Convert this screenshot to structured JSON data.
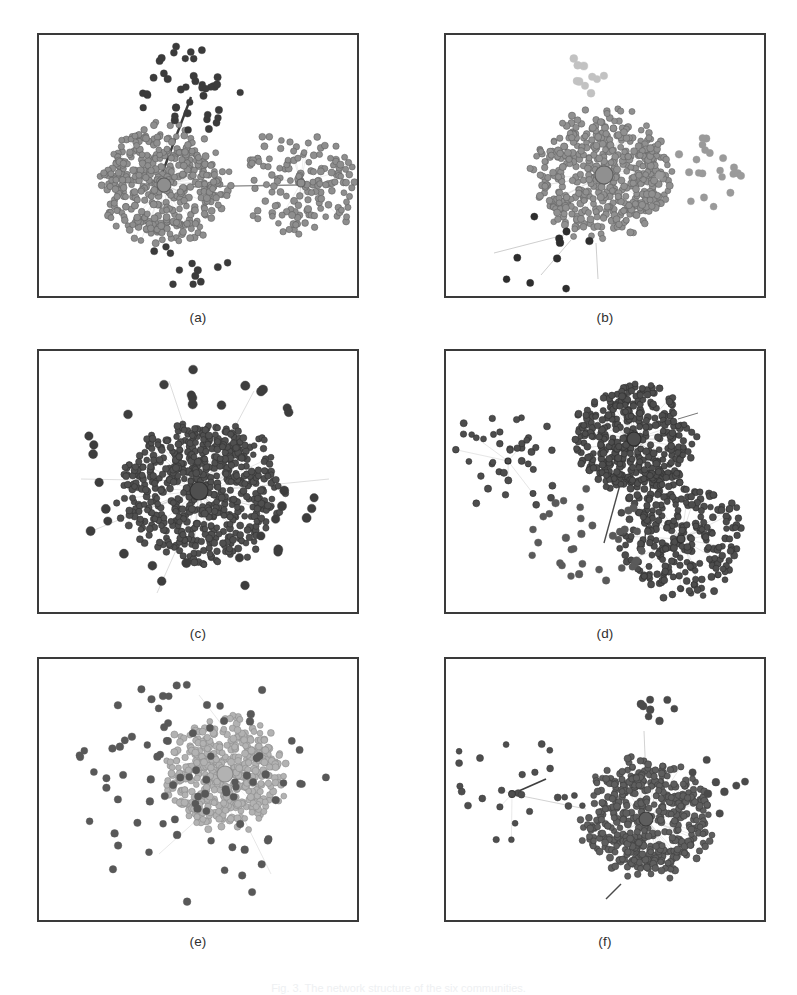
{
  "figure": {
    "caption": "Fig. 3. The network structure of the six communities.",
    "caption_color": "#eef0f2",
    "background": "#ffffff",
    "frame_color": "#3a3a3a",
    "width": 797,
    "height": 995
  },
  "layout": {
    "columns": 2,
    "rows": 3,
    "panel_width": 322,
    "panel_height": 265,
    "col_x": [
      37,
      444
    ],
    "row_y": [
      33,
      349,
      657
    ],
    "label_offset_y": 12
  },
  "panels": [
    {
      "id": "a",
      "label": "(a)",
      "node_color": "#8e8e8e",
      "node_stroke": "#5d5d5d",
      "outlier_color": "#3b3b3b",
      "edge_color": "#c9c9c9",
      "long_edge_color": "#4a4a4a",
      "description": "two dense communities joined by long bridge edges",
      "chart": {
        "seed": 1207,
        "clusters": [
          {
            "cx": 125,
            "cy": 150,
            "r": 62,
            "n": 430,
            "shade": "#8e8e8e",
            "hub": true,
            "hub_r": 7,
            "spread": 1.0
          },
          {
            "cx": 262,
            "cy": 148,
            "r": 46,
            "n": 150,
            "shade": "#8e8e8e",
            "hub": true,
            "hub_r": 4,
            "spread": 1.25
          }
        ],
        "outliers": [
          {
            "cx": 150,
            "cy": 55,
            "r": 52,
            "n": 42,
            "shade": "#3b3b3b",
            "size": 3.3
          },
          {
            "cx": 150,
            "cy": 232,
            "r": 44,
            "n": 12,
            "shade": "#3b3b3b",
            "size": 3.3
          }
        ],
        "bridges": [
          {
            "x1": 118,
            "y1": 152,
            "x2": 152,
            "y2": 62,
            "w": 2.4,
            "color": "#3d3d3d"
          },
          {
            "x1": 140,
            "y1": 152,
            "x2": 258,
            "y2": 150,
            "w": 1.3,
            "color": "#8a8a8a"
          }
        ]
      }
    },
    {
      "id": "b",
      "label": "(b)",
      "node_color": "#909090",
      "node_stroke": "#5f5f5f",
      "outlier_color": "#2e2e2e",
      "edge_color": "#cccccc",
      "long_edge_color": "#9a9a9a",
      "description": "single giant community with a large central hub, light satellites above, dark isolates below",
      "chart": {
        "seed": 3391,
        "clusters": [
          {
            "cx": 158,
            "cy": 140,
            "r": 66,
            "n": 520,
            "shade": "#909090",
            "hub": true,
            "hub_r": 9,
            "spread": 1.0
          }
        ],
        "outliers": [
          {
            "cx": 140,
            "cy": 42,
            "r": 24,
            "n": 10,
            "shade": "#c2c2c2",
            "size": 3.6
          },
          {
            "cx": 255,
            "cy": 140,
            "r": 42,
            "n": 22,
            "shade": "#9a9a9a",
            "size": 3.4
          },
          {
            "cx": 110,
            "cy": 228,
            "r": 56,
            "n": 10,
            "shade": "#2e2e2e",
            "size": 3.4
          }
        ],
        "bridges": [
          {
            "x1": 118,
            "y1": 200,
            "x2": 48,
            "y2": 218,
            "w": 0.8,
            "color": "#c2c2c2"
          },
          {
            "x1": 125,
            "y1": 205,
            "x2": 95,
            "y2": 240,
            "w": 0.8,
            "color": "#c2c2c2"
          },
          {
            "x1": 150,
            "y1": 208,
            "x2": 152,
            "y2": 244,
            "w": 0.8,
            "color": "#c2c2c2"
          }
        ]
      }
    },
    {
      "id": "c",
      "label": "(c)",
      "node_color": "#4f4f4f",
      "node_stroke": "#303030",
      "outlier_color": "#3a3a3a",
      "edge_color": "#b8b8b8",
      "long_edge_color": "#c0c0c0",
      "description": "one very dense dark community with radiating pendant nodes",
      "chart": {
        "seed": 5523,
        "clusters": [
          {
            "cx": 160,
            "cy": 140,
            "r": 76,
            "n": 640,
            "shade": "#4f4f4f",
            "hub": true,
            "hub_r": 9,
            "spread": 1.0
          }
        ],
        "outliers": [
          {
            "cx": 160,
            "cy": 130,
            "r": 118,
            "n": 34,
            "shade": "#3d3d3d",
            "size": 4.2,
            "ring": true
          }
        ],
        "bridges": [
          {
            "x1": 150,
            "y1": 130,
            "x2": 42,
            "y2": 128,
            "w": 0.7,
            "color": "#cfcfcf"
          },
          {
            "x1": 150,
            "y1": 140,
            "x2": 48,
            "y2": 182,
            "w": 0.7,
            "color": "#cfcfcf"
          },
          {
            "x1": 160,
            "y1": 120,
            "x2": 130,
            "y2": 30,
            "w": 0.7,
            "color": "#cfcfcf"
          },
          {
            "x1": 170,
            "y1": 125,
            "x2": 215,
            "y2": 40,
            "w": 0.7,
            "color": "#cfcfcf"
          },
          {
            "x1": 190,
            "y1": 138,
            "x2": 290,
            "y2": 128,
            "w": 0.7,
            "color": "#cfcfcf"
          },
          {
            "x1": 150,
            "y1": 170,
            "x2": 118,
            "y2": 242,
            "w": 0.7,
            "color": "#cfcfcf"
          }
        ]
      }
    },
    {
      "id": "d",
      "label": "(d)",
      "node_color": "#4d4d4d",
      "node_stroke": "#2c2c2c",
      "outlier_color": "#4a4a4a",
      "edge_color": "#b5b5b5",
      "long_edge_color": "#555555",
      "description": "three communities: small left satellite, large upper-centre core, lower-right star community",
      "chart": {
        "seed": 7741,
        "clusters": [
          {
            "cx": 188,
            "cy": 88,
            "r": 58,
            "n": 400,
            "shade": "#4d4d4d",
            "hub": true,
            "hub_r": 7,
            "spread": 1.0
          },
          {
            "cx": 235,
            "cy": 188,
            "r": 48,
            "n": 250,
            "shade": "#4d4d4d",
            "hub": true,
            "hub_r": 4,
            "spread": 1.25
          },
          {
            "cx": 62,
            "cy": 110,
            "r": 34,
            "n": 40,
            "shade": "#4d4d4d",
            "hub": true,
            "hub_r": 3,
            "spread": 1.6
          }
        ],
        "outliers": [
          {
            "cx": 140,
            "cy": 185,
            "r": 60,
            "n": 34,
            "shade": "#5a5a5a",
            "size": 3.4
          }
        ],
        "bridges": [
          {
            "x1": 175,
            "y1": 130,
            "x2": 158,
            "y2": 192,
            "w": 1.4,
            "color": "#4a4a4a"
          },
          {
            "x1": 205,
            "y1": 132,
            "x2": 198,
            "y2": 196,
            "w": 1.4,
            "color": "#4a4a4a"
          },
          {
            "x1": 232,
            "y1": 68,
            "x2": 252,
            "y2": 62,
            "w": 1.0,
            "color": "#777777"
          }
        ]
      }
    },
    {
      "id": "e",
      "label": "(e)",
      "node_color": "#b2b2b2",
      "node_stroke": "#8a8a8a",
      "outlier_color": "#555555",
      "edge_color": "#d8d8d8",
      "long_edge_color": "#cfcfcf",
      "description": "light-toned central community surrounded by many dark scattered isolates",
      "chart": {
        "seed": 9013,
        "clusters": [
          {
            "cx": 186,
            "cy": 115,
            "r": 58,
            "n": 470,
            "shade": "#b2b2b2",
            "hub": true,
            "hub_r": 8,
            "spread": 1.0
          }
        ],
        "outliers": [
          {
            "cx": 160,
            "cy": 130,
            "r": 128,
            "n": 86,
            "shade": "#585858",
            "size": 3.4,
            "ring": false
          }
        ],
        "bridges": [
          {
            "x1": 170,
            "y1": 150,
            "x2": 120,
            "y2": 195,
            "w": 0.7,
            "color": "#dcdcdc"
          },
          {
            "x1": 200,
            "y1": 150,
            "x2": 232,
            "y2": 215,
            "w": 0.7,
            "color": "#dcdcdc"
          },
          {
            "x1": 186,
            "y1": 70,
            "x2": 160,
            "y2": 36,
            "w": 0.7,
            "color": "#dcdcdc"
          }
        ]
      }
    },
    {
      "id": "f",
      "label": "(f)",
      "node_color": "#5e5e5e",
      "node_stroke": "#3a3a3a",
      "outlier_color": "#4a4a4a",
      "edge_color": "#c0c0c0",
      "long_edge_color": "#3f3f3f",
      "description": "large dark community on the right linked to a small star-shaped community on the left",
      "chart": {
        "seed": 2468,
        "clusters": [
          {
            "cx": 200,
            "cy": 160,
            "r": 62,
            "n": 470,
            "shade": "#5e5e5e",
            "hub": true,
            "hub_r": 7,
            "spread": 1.0
          },
          {
            "cx": 66,
            "cy": 135,
            "r": 36,
            "n": 26,
            "shade": "#4e4e4e",
            "hub": true,
            "hub_r": 3.4,
            "spread": 1.9
          }
        ],
        "outliers": [
          {
            "cx": 205,
            "cy": 60,
            "r": 28,
            "n": 8,
            "shade": "#4a4a4a",
            "size": 3.5
          },
          {
            "cx": 278,
            "cy": 130,
            "r": 40,
            "n": 8,
            "shade": "#4a4a4a",
            "size": 3.5
          }
        ],
        "bridges": [
          {
            "x1": 66,
            "y1": 135,
            "x2": 100,
            "y2": 120,
            "w": 1.8,
            "color": "#3f3f3f"
          },
          {
            "x1": 66,
            "y1": 135,
            "x2": 140,
            "y2": 150,
            "w": 0.8,
            "color": "#c6c6c6"
          },
          {
            "x1": 200,
            "y1": 120,
            "x2": 198,
            "y2": 72,
            "w": 0.8,
            "color": "#c6c6c6"
          },
          {
            "x1": 175,
            "y1": 225,
            "x2": 160,
            "y2": 240,
            "w": 1.4,
            "color": "#4a4a4a"
          }
        ]
      }
    }
  ]
}
